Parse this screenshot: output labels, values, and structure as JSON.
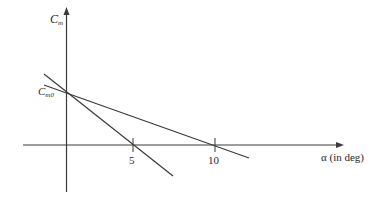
{
  "diagram": {
    "title": "",
    "colors": {
      "line": "#3a3a3a",
      "axis": "#3a3a3a",
      "text": "#2a2a2a",
      "background": "#ffffff"
    },
    "y_axis": {
      "label_main": "C",
      "label_sub": "m"
    },
    "x_axis": {
      "label": "α (in deg)",
      "ticks": [
        {
          "label": "5"
        },
        {
          "label": "10"
        }
      ]
    },
    "intercept": {
      "label_main": "C",
      "label_sub": "m0"
    },
    "lines": [
      {
        "name": "steep-line",
        "description": "Cm vs alpha, steeper negative slope, crosses alpha axis near 5"
      },
      {
        "name": "shallow-line",
        "description": "Cm vs alpha, shallower negative slope, crosses alpha axis near 10"
      }
    ]
  }
}
